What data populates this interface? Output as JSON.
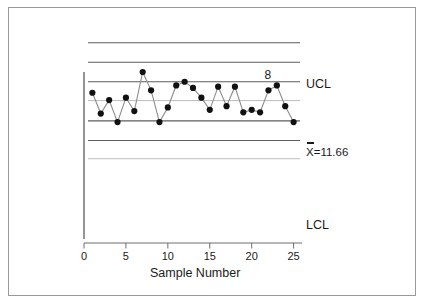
{
  "chart_data": {
    "type": "line",
    "title": "",
    "xlabel": "Sample Number",
    "ylabel": "",
    "xlim": [
      0,
      26
    ],
    "ylim": [
      0,
      14
    ],
    "grid": false,
    "legend": "none",
    "x": [
      1,
      2,
      3,
      4,
      5,
      6,
      7,
      8,
      9,
      10,
      11,
      12,
      13,
      14,
      15,
      16,
      17,
      18,
      19,
      20,
      21,
      22,
      23,
      24,
      25
    ],
    "values": [
      12.3,
      10.6,
      11.7,
      9.9,
      11.9,
      10.8,
      14.0,
      12.5,
      9.9,
      11.1,
      12.9,
      13.2,
      12.7,
      11.9,
      10.9,
      12.8,
      11.2,
      12.8,
      10.7,
      10.9,
      10.7,
      12.5,
      12.9,
      11.2,
      9.9
    ],
    "xtick_labels": [
      "0",
      "5",
      "10",
      "15",
      "20",
      "25"
    ],
    "xtick_values": [
      0,
      5,
      10,
      15,
      20,
      25
    ],
    "reference_lines": [
      {
        "name": "UCL",
        "label": "UCL",
        "value": 16.4,
        "style": "solid",
        "shade": "dark"
      },
      {
        "name": "plus-two-sigma",
        "label": "",
        "value": 14.8,
        "style": "solid",
        "shade": "dark"
      },
      {
        "name": "plus-one-sigma",
        "label": "",
        "value": 13.2,
        "style": "solid",
        "shade": "dark"
      },
      {
        "name": "center-line",
        "label": "X=11.66",
        "value": 11.66,
        "style": "solid",
        "shade": "light"
      },
      {
        "name": "minus-one-sigma",
        "label": "",
        "value": 10.0,
        "style": "solid",
        "shade": "dark"
      },
      {
        "name": "minus-two-sigma",
        "label": "",
        "value": 8.4,
        "style": "solid",
        "shade": "dark"
      },
      {
        "name": "LCL",
        "label": "LCL",
        "value": 6.9,
        "style": "solid",
        "shade": "light"
      }
    ],
    "annotations": [
      {
        "name": "rule-violation-8",
        "text": "8",
        "x": 22,
        "y": 13.6
      }
    ],
    "center_value": "11.66",
    "center_label_text": "X=11.66",
    "ucl_label_text": "UCL",
    "lcl_label_text": "LCL",
    "marker": "filled-circle",
    "marker_color": "#111111",
    "line_color": "#8c8c8c"
  },
  "labels": {
    "ucl": "UCL",
    "lcl": "LCL",
    "center": "X=11.66",
    "violation": "8",
    "xaxis_title": "Sample Number",
    "ticks": [
      "0",
      "5",
      "10",
      "15",
      "20",
      "25"
    ]
  },
  "colors": {
    "background": "#ffffff",
    "frame_border": "#9a9a9a",
    "reference_line_dark": "#5d5d5d",
    "reference_line_light": "#b4b4b4",
    "series_line": "#8c8c8c",
    "marker": "#111111",
    "axis": "#6e6e6e",
    "text": "#1a1a1a"
  }
}
